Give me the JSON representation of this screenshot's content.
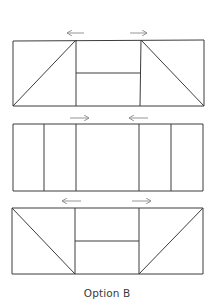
{
  "caption": "Option B",
  "colors": {
    "line": "#3c3c3c",
    "arrow": "#8a8a8a",
    "background": "#ffffff"
  },
  "panels": [
    {
      "name": "top-panel",
      "arrows": [
        {
          "direction": "left"
        },
        {
          "direction": "right"
        }
      ],
      "layout": "two triangles flanking a center split into two horizontal halves; left diagonal rises to center, right diagonal falls from center"
    },
    {
      "name": "middle-panel",
      "arrows": [
        {
          "direction": "right"
        },
        {
          "direction": "left"
        }
      ],
      "layout": "five vertical strips: two narrow left, one wide center, two narrow right"
    },
    {
      "name": "bottom-panel",
      "arrows": [
        {
          "direction": "left"
        },
        {
          "direction": "right"
        }
      ],
      "layout": "two triangles flanking a center split into two horizontal halves; diagonals mirrored from top panel"
    }
  ]
}
